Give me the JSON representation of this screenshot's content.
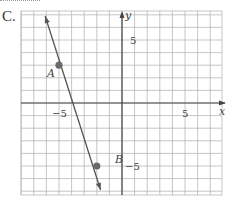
{
  "choice_label": "C.",
  "chart_data": {
    "type": "line",
    "title": "",
    "xlabel": "x",
    "ylabel": "y",
    "xlim": [
      -8,
      8
    ],
    "ylim": [
      -7,
      7
    ],
    "grid": true,
    "x_ticks_labeled": [
      -5,
      5
    ],
    "y_ticks_labeled": [
      5,
      -5
    ],
    "tick_labels": {
      "x_neg": "−5",
      "x_pos": "5",
      "y_pos": "5",
      "y_neg": "−5"
    },
    "points": [
      {
        "label": "A",
        "x": -5,
        "y": 3
      },
      {
        "label": "B",
        "x": -2,
        "y": -5
      }
    ],
    "series": [
      {
        "name": "line AB",
        "x": [
          -6.1,
          -1.7
        ],
        "y": [
          6.9,
          -6.9
        ],
        "arrows": "both"
      }
    ],
    "colors": {
      "grid": "#b8b8b8",
      "axis": "#444444",
      "line": "#555555",
      "point": "#6a6a6a"
    }
  }
}
